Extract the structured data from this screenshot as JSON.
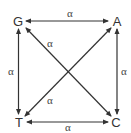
{
  "diagram": {
    "title": "",
    "nodes": [
      {
        "id": "G",
        "label": "G",
        "x": 18,
        "y": 21
      },
      {
        "id": "A",
        "label": "A",
        "x": 117,
        "y": 21
      },
      {
        "id": "T",
        "label": "T",
        "x": 19,
        "y": 122
      },
      {
        "id": "C",
        "label": "C",
        "x": 116,
        "y": 122
      }
    ],
    "edges": [
      {
        "from": "G",
        "to": "A",
        "label": "α",
        "bidirectional": true
      },
      {
        "from": "T",
        "to": "C",
        "label": "α",
        "bidirectional": true
      },
      {
        "from": "G",
        "to": "T",
        "label": "α",
        "bidirectional": true
      },
      {
        "from": "A",
        "to": "C",
        "label": "α",
        "bidirectional": true
      },
      {
        "from": "G",
        "to": "C",
        "label": "α",
        "bidirectional": true
      },
      {
        "from": "T",
        "to": "A",
        "label": "α",
        "bidirectional": true
      }
    ],
    "colors": {
      "line": "#333333",
      "text": "#333333"
    }
  }
}
